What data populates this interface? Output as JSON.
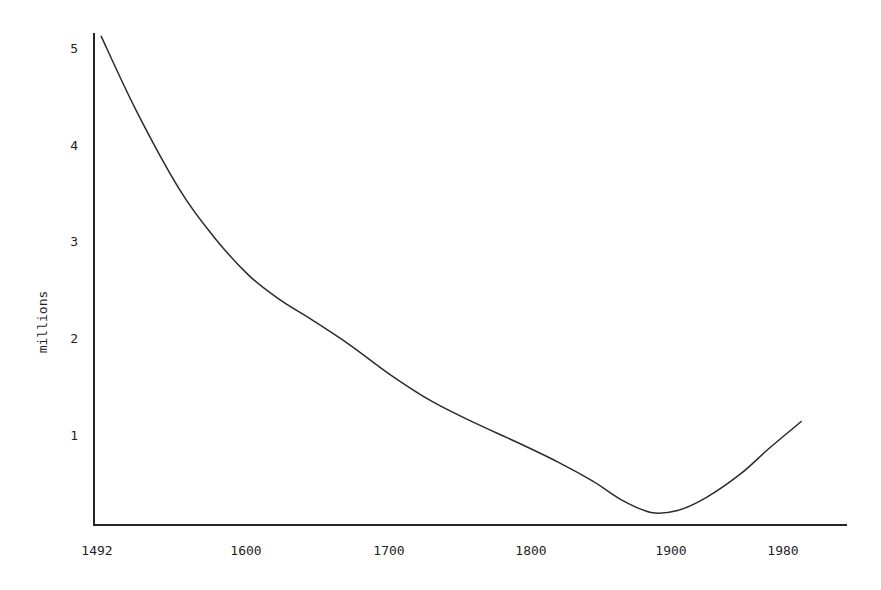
{
  "chart_data": {
    "type": "line",
    "title": "",
    "subtitle": "",
    "xlabel": "",
    "ylabel": "millions",
    "xlim": [
      1492,
      2000
    ],
    "ylim": [
      0,
      5.3
    ],
    "grid": false,
    "legend": null,
    "x_ticks": [
      1492,
      1600,
      1700,
      1800,
      1900,
      1980
    ],
    "x_tick_labels": [
      "1492",
      "1600",
      "1700",
      "1800",
      "1900",
      "1980"
    ],
    "y_ticks": [
      1,
      2,
      3,
      4,
      5
    ],
    "y_tick_labels": [
      "1",
      "2",
      "3",
      "4",
      "5"
    ],
    "series": [
      {
        "name": "population",
        "x": [
          1495,
          1520,
          1551,
          1575,
          1600,
          1622,
          1645,
          1672,
          1701,
          1730,
          1760,
          1790,
          1820,
          1845,
          1865,
          1886,
          1905,
          1925,
          1950,
          1970,
          1993
        ],
        "values": [
          5.12,
          4.35,
          3.53,
          3.05,
          2.65,
          2.4,
          2.19,
          1.93,
          1.62,
          1.35,
          1.13,
          0.93,
          0.72,
          0.52,
          0.33,
          0.2,
          0.22,
          0.35,
          0.6,
          0.86,
          1.14
        ]
      }
    ],
    "annotations": []
  },
  "axis": {
    "y_title": "millions"
  },
  "ticks": {
    "x": [
      {
        "label": "1492"
      },
      {
        "label": "1600"
      },
      {
        "label": "1700"
      },
      {
        "label": "1800"
      },
      {
        "label": "1900"
      },
      {
        "label": "1980"
      }
    ],
    "y": [
      {
        "label": "5"
      },
      {
        "label": "4"
      },
      {
        "label": "3"
      },
      {
        "label": "2"
      },
      {
        "label": "1"
      }
    ]
  },
  "colors": {
    "curve": "#2b2b2b",
    "axis": "#262626",
    "text": "#1f1f1f",
    "background": "#ffffff"
  }
}
